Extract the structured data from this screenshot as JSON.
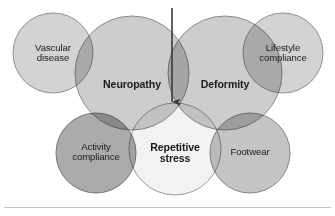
{
  "figure": {
    "type": "venn-overlap-diagram",
    "background_color": "#ffffff",
    "title": "",
    "arrow": {
      "name": "downward-arrow",
      "orientation": "down",
      "x": 172,
      "y_start": 8,
      "y_end": 111,
      "color": "#3a3a3a"
    },
    "divider": {
      "color": "#c4c4c4",
      "y": 207
    },
    "circles": [
      {
        "id": "vascular-disease",
        "label": "Vascular\ndisease",
        "emphasis": "plain",
        "cx": 53,
        "cy": 53,
        "r": 40,
        "fill": "#c9c9c9",
        "stroke": "#8f8f8f",
        "opacity": 0.82
      },
      {
        "id": "lifestyle-compliance",
        "label": "Lifestyle\ncompliance",
        "emphasis": "plain",
        "cx": 283,
        "cy": 53,
        "r": 40,
        "fill": "#c9c9c9",
        "stroke": "#8f8f8f",
        "opacity": 0.82
      },
      {
        "id": "neuropathy",
        "label": "Neuropathy",
        "emphasis": "bold",
        "cx": 132,
        "cy": 73,
        "r": 57,
        "fill": "#c2c2c2",
        "stroke": "#8a8a8a",
        "opacity": 0.82
      },
      {
        "id": "deformity",
        "label": "Deformity",
        "emphasis": "bold",
        "cx": 225,
        "cy": 73,
        "r": 57,
        "fill": "#c2c2c2",
        "stroke": "#8a8a8a",
        "opacity": 0.82
      },
      {
        "id": "activity-compliance",
        "label": "Activity\ncompliance",
        "emphasis": "plain",
        "cx": 96,
        "cy": 153,
        "r": 40,
        "fill": "#9d9d9d",
        "stroke": "#757575",
        "opacity": 0.86
      },
      {
        "id": "footwear",
        "label": "Footwear",
        "emphasis": "plain",
        "cx": 250,
        "cy": 153,
        "r": 40,
        "fill": "#b9b9b9",
        "stroke": "#858585",
        "opacity": 0.84
      },
      {
        "id": "repetitive-stress",
        "label": "Repetitive\nstress",
        "emphasis": "bold",
        "cx": 175,
        "cy": 149,
        "r": 46,
        "fill": "#f1f1f1",
        "stroke": "#9a9a9a",
        "opacity": 0.9
      }
    ]
  }
}
